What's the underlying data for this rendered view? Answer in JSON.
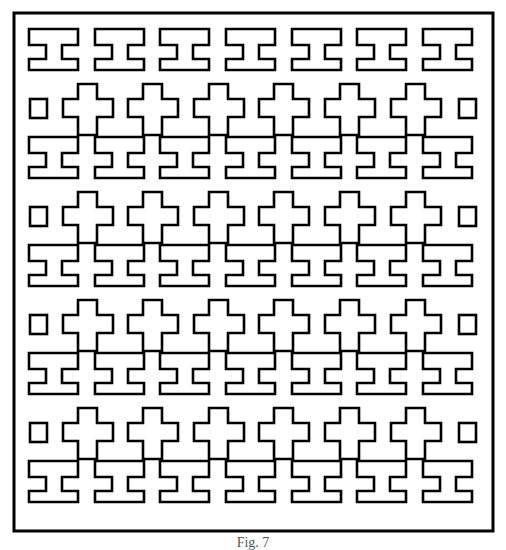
{
  "figure": {
    "type": "lattice-pattern",
    "stroke_color": "#000000",
    "background_color": "#ffffff",
    "frame": {
      "x": 14,
      "y": 13,
      "width": 479,
      "height": 518,
      "stroke_width": 3
    },
    "i_shape": {
      "rows_y": [
        29,
        137,
        245,
        353,
        461
      ],
      "cols_x": [
        29,
        95,
        160,
        226,
        292,
        357,
        423
      ],
      "width": 49,
      "height": 41,
      "stem_left": 17,
      "stem_right": 33,
      "notch_top": 16,
      "notch_bottom": 30
    },
    "cross_shape": {
      "rows_y": [
        84,
        192,
        300,
        408
      ],
      "cols_x": [
        63,
        128,
        194,
        259,
        325,
        391
      ],
      "width": 50,
      "height": 51,
      "arm_left": 15,
      "arm_right": 34,
      "bar_top": 15,
      "bar_bottom": 33
    },
    "end_squares": {
      "left_x": 30,
      "right_x": 459,
      "rows_y": [
        99,
        207,
        315,
        423
      ],
      "width": 17,
      "height": 19
    },
    "line_width": 2.6
  },
  "caption": {
    "text": "Fig. 7"
  }
}
